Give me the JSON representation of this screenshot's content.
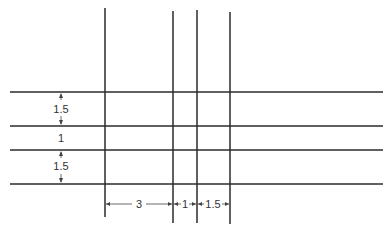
{
  "diagram": {
    "line_color": "#2b2b2b",
    "dim_color": "#444444",
    "horizontal_lines": [
      92,
      126,
      150,
      184
    ],
    "vertical_lines": [
      {
        "x": 105,
        "top": 8,
        "bottom": 217
      },
      {
        "x": 173,
        "top": 11,
        "bottom": 223
      },
      {
        "x": 197,
        "top": 10,
        "bottom": 223
      },
      {
        "x": 230,
        "top": 12,
        "bottom": 224
      }
    ],
    "row_dimensions": [
      {
        "label": "1.5",
        "from": 92,
        "to": 126
      },
      {
        "label": "1",
        "from": 126,
        "to": 150
      },
      {
        "label": "1.5",
        "from": 150,
        "to": 184
      }
    ],
    "column_dimensions": [
      {
        "label": "3",
        "from": 105,
        "to": 173
      },
      {
        "label": "1",
        "from": 173,
        "to": 197
      },
      {
        "label": "1.5",
        "from": 197,
        "to": 230
      }
    ]
  }
}
